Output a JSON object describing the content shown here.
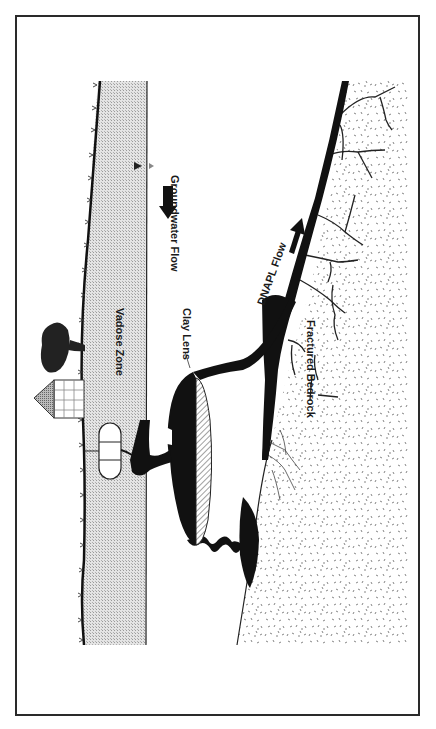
{
  "figure": {
    "orientation": "rotated-90-clockwise",
    "labels": {
      "groundwater_flow": "Groundwater Flow",
      "vadose_zone": "Vadose Zone",
      "clay_lens": "Clay Lens",
      "dnapl_flow": "DNAPL Flow",
      "fractured_bedrock": "Fractured Bedrock"
    },
    "icons": [
      "tree-icon",
      "house-icon",
      "storage-tank-icon",
      "water-table-symbol",
      "groundwater-flow-arrow",
      "dnapl-flow-arrow"
    ],
    "colors": {
      "frame": "#2a2a2a",
      "dnapl": "#111111",
      "vadose_fill": "#d8d8d8",
      "bedrock_speckle": "#777777",
      "water_table_marker": "#555555"
    }
  }
}
